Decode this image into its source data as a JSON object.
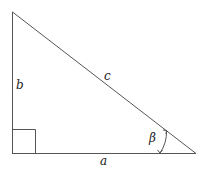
{
  "diagram": {
    "type": "right-triangle",
    "labels": {
      "side_a": "a",
      "side_b": "b",
      "side_c": "c",
      "angle": "β"
    },
    "vertices": {
      "top": [
        12,
        12
      ],
      "right_angle": [
        12,
        153
      ],
      "acute": [
        196,
        153
      ]
    },
    "right_angle_marker": true,
    "angle_arc_marks": "β",
    "colors": {
      "stroke": "#555555",
      "text": "#222222",
      "background": "#ffffff"
    }
  }
}
